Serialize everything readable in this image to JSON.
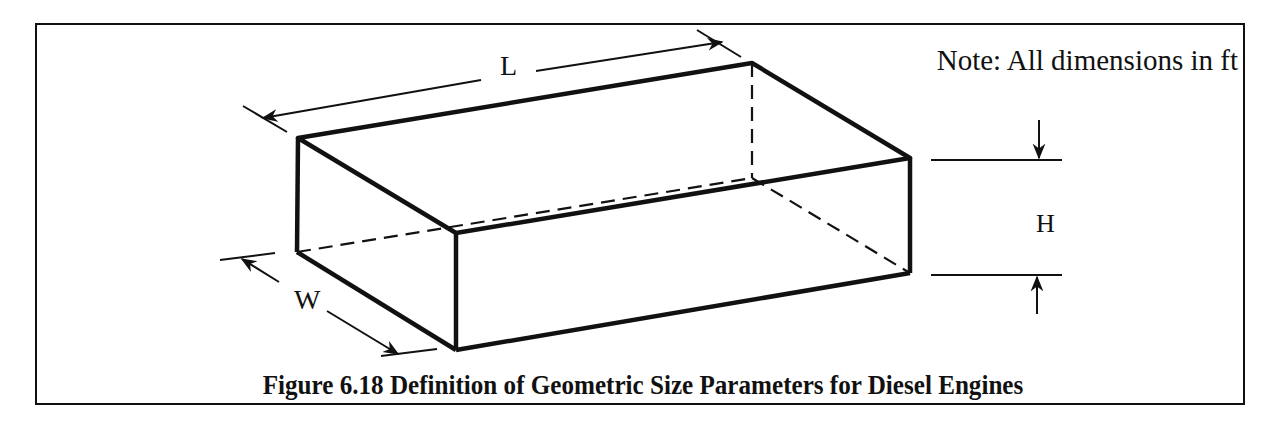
{
  "figure": {
    "caption": "Figure 6.18 Definition of Geometric Size Parameters for Diesel Engines",
    "note": "Note: All dimensions in ft",
    "dimensions": {
      "length_label": "L",
      "height_label": "H",
      "width_label": "W"
    },
    "colors": {
      "line": "#111111",
      "background": "#ffffff"
    }
  }
}
